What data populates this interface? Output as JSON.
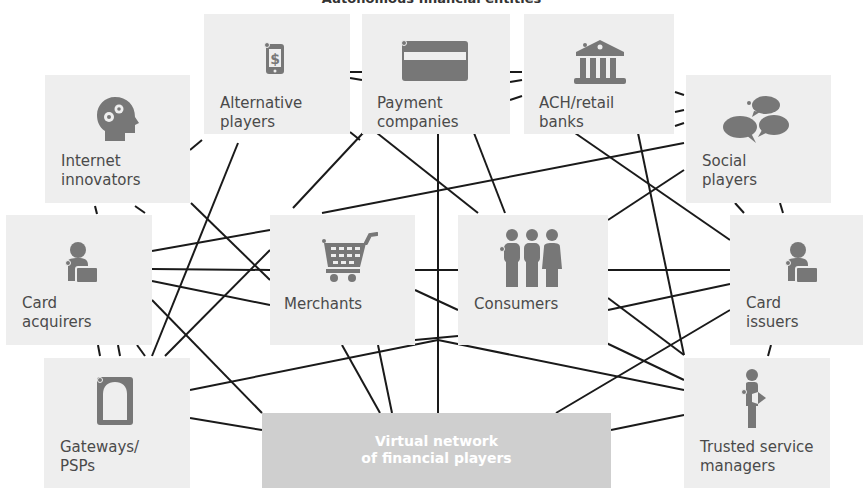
{
  "title": "Autonomous financial entities",
  "colors": {
    "box": "#eeeeee",
    "icon": "#777777",
    "line": "#1a1a1a",
    "vnet_box": "#cfcfcf",
    "vnet_text": "#ffffff"
  },
  "nodes": [
    {
      "id": "alternative",
      "label": "Alternative\nplayers",
      "icon": "phone-dollar-icon"
    },
    {
      "id": "payment",
      "label": "Payment\ncompanies",
      "icon": "credit-card-icon"
    },
    {
      "id": "ach",
      "label": "ACH/retail\nbanks",
      "icon": "bank-icon"
    },
    {
      "id": "internet",
      "label": "Internet\ninnovators",
      "icon": "head-gears-icon"
    },
    {
      "id": "social",
      "label": "Social\nplayers",
      "icon": "speech-bubbles-icon"
    },
    {
      "id": "acquirers",
      "label": "Card\nacquirers",
      "icon": "person-card-icon"
    },
    {
      "id": "merchants",
      "label": "Merchants",
      "icon": "shopping-cart-icon"
    },
    {
      "id": "consumers",
      "label": "Consumers",
      "icon": "people-group-icon"
    },
    {
      "id": "issuers",
      "label": "Card\nissuers",
      "icon": "person-card-icon"
    },
    {
      "id": "gateways",
      "label": "Gateways/\nPSPs",
      "icon": "gateway-door-icon"
    },
    {
      "id": "tsm",
      "label": "Trusted service\nmanagers",
      "icon": "person-badge-icon"
    }
  ],
  "virtual_network": {
    "label": "Virtual network\nof financial players"
  }
}
